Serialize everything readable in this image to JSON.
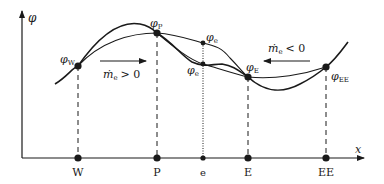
{
  "diagram": {
    "axes": {
      "y_label": "φ",
      "x_label": "x"
    },
    "nodes": [
      {
        "id": "W",
        "label": "W",
        "value_label": "φ",
        "value_sub": "W"
      },
      {
        "id": "P",
        "label": "P",
        "value_label": "φ",
        "value_sub": "P"
      },
      {
        "id": "e",
        "label": "e"
      },
      {
        "id": "E",
        "label": "E",
        "value_label": "φ",
        "value_sub": "E"
      },
      {
        "id": "EE",
        "label": "EE",
        "value_label": "φ",
        "value_sub": "EE"
      }
    ],
    "face_values": {
      "upper": {
        "symbol": "φ",
        "sub": "e"
      },
      "lower": {
        "symbol": "φ",
        "sub": "e"
      }
    },
    "flow_annotations": {
      "positive": {
        "symbol": "ṁ",
        "sub": "e",
        "relation": "> 0",
        "direction": "right"
      },
      "negative": {
        "symbol": "ṁ",
        "sub": "e",
        "relation": "< 0",
        "direction": "left"
      }
    },
    "colors": {
      "line": "#1a1a1a",
      "background": "#ffffff"
    }
  }
}
